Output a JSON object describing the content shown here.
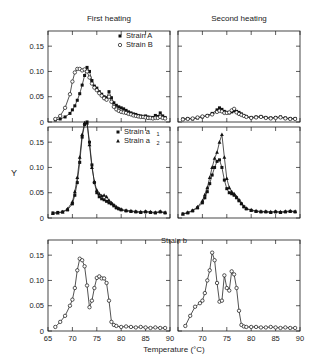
{
  "figure": {
    "y_axis_label": "Y",
    "x_axis_label": "Temperature (°C)",
    "column_titles": [
      "First heating",
      "Second heating"
    ],
    "y_ticks": [
      "0",
      "0.05",
      "0.10",
      "0.15"
    ],
    "x_ticks": [
      "65",
      "70",
      "75",
      "80",
      "85",
      "90"
    ],
    "legends": {
      "row1": [
        {
          "label": "Strain A",
          "marker": "filled-square"
        },
        {
          "label": "Strain B",
          "marker": "open-circle"
        }
      ],
      "row2": [
        {
          "label": "Strain a",
          "sub": "1",
          "marker": "filled-square"
        },
        {
          "label": "Strain a",
          "sub": "2",
          "marker": "filled-triangle"
        }
      ],
      "row3": [
        {
          "label": "Strain b",
          "marker": "open-circle"
        }
      ]
    }
  },
  "chart_data": {
    "type": "line",
    "title": "",
    "xlabel": "Temperature (°C)",
    "ylabel": "Y",
    "xlim": [
      65,
      90
    ],
    "ylim": [
      0,
      0.18
    ],
    "grid": false,
    "legend_position": "inside-top-right",
    "panels": [
      {
        "row": 1,
        "column": 1,
        "column_title": "First heating",
        "series": [
          {
            "name": "Strain A",
            "marker": "filled-square",
            "x": [
              66.5,
              67.5,
              68.5,
              69.5,
              70.0,
              70.5,
              71.0,
              71.5,
              72.0,
              72.5,
              73.0,
              73.5,
              74.0,
              74.5,
              75.0,
              75.5,
              76.0,
              76.5,
              77.0,
              77.5,
              78.0,
              78.5,
              79.0,
              79.5,
              80.0,
              80.5,
              81.0,
              81.5,
              82.0,
              82.5,
              83.0,
              83.5,
              84.0,
              84.5,
              85.0,
              85.5,
              86.0,
              86.5,
              87.0,
              87.5,
              88.0,
              88.5,
              89.0
            ],
            "y": [
              0.004,
              0.006,
              0.01,
              0.017,
              0.024,
              0.032,
              0.043,
              0.056,
              0.073,
              0.092,
              0.108,
              0.1,
              0.082,
              0.071,
              0.067,
              0.06,
              0.055,
              0.05,
              0.048,
              0.06,
              0.048,
              0.038,
              0.033,
              0.03,
              0.028,
              0.026,
              0.023,
              0.02,
              0.018,
              0.016,
              0.015,
              0.013,
              0.012,
              0.011,
              0.012,
              0.01,
              0.009,
              0.009,
              0.013,
              0.011,
              0.018,
              0.012,
              0.009
            ]
          },
          {
            "name": "Strain B",
            "marker": "open-circle",
            "x": [
              66.5,
              67.5,
              68.5,
              69.5,
              70.0,
              70.5,
              71.0,
              71.5,
              72.0,
              72.5,
              73.0,
              73.5,
              74.0,
              74.5,
              75.0,
              75.5,
              76.0,
              76.5,
              77.0,
              77.5,
              78.0,
              78.5,
              79.0,
              79.5,
              80.0,
              80.5,
              81.0,
              81.5,
              82.0,
              82.5,
              83.0,
              83.5,
              84.0,
              84.5,
              85.0,
              85.5,
              86.0,
              86.5,
              87.0,
              87.5,
              88.0,
              88.5,
              89.0
            ],
            "y": [
              0.006,
              0.012,
              0.028,
              0.055,
              0.08,
              0.098,
              0.105,
              0.105,
              0.102,
              0.104,
              0.1,
              0.088,
              0.076,
              0.068,
              0.063,
              0.057,
              0.052,
              0.047,
              0.044,
              0.05,
              0.04,
              0.03,
              0.025,
              0.022,
              0.02,
              0.019,
              0.018,
              0.016,
              0.015,
              0.013,
              0.012,
              0.011,
              0.01,
              0.01,
              0.009,
              0.008,
              0.008,
              0.007,
              0.008,
              0.008,
              0.01,
              0.008,
              0.007
            ]
          }
        ]
      },
      {
        "row": 1,
        "column": 2,
        "column_title": "Second heating",
        "series": [
          {
            "name": "Strain A",
            "marker": "filled-square",
            "x": [
              66.0,
              67.0,
              68.0,
              69.0,
              70.0,
              71.0,
              72.0,
              73.0,
              73.5,
              74.0,
              74.5,
              75.0,
              75.5,
              76.0,
              76.5,
              77.0,
              77.5,
              78.0,
              78.5,
              79.0,
              80.0,
              81.0,
              82.0,
              83.0,
              84.0,
              85.0,
              86.0,
              87.0,
              88.0,
              89.0
            ],
            "y": [
              0.006,
              0.007,
              0.006,
              0.008,
              0.01,
              0.013,
              0.017,
              0.024,
              0.028,
              0.025,
              0.021,
              0.019,
              0.018,
              0.02,
              0.022,
              0.021,
              0.019,
              0.016,
              0.013,
              0.011,
              0.009,
              0.01,
              0.011,
              0.009,
              0.008,
              0.009,
              0.01,
              0.008,
              0.007,
              0.007
            ]
          },
          {
            "name": "Strain B",
            "marker": "open-circle",
            "x": [
              66.0,
              67.0,
              68.0,
              69.0,
              70.0,
              71.0,
              72.0,
              73.0,
              73.5,
              74.0,
              74.5,
              75.0,
              75.5,
              76.0,
              76.5,
              77.0,
              77.5,
              78.0,
              78.5,
              79.0,
              80.0,
              81.0,
              82.0,
              83.0,
              84.0,
              85.0,
              86.0,
              87.0,
              88.0,
              89.0
            ],
            "y": [
              0.005,
              0.006,
              0.007,
              0.009,
              0.011,
              0.012,
              0.015,
              0.02,
              0.022,
              0.021,
              0.018,
              0.018,
              0.019,
              0.023,
              0.026,
              0.019,
              0.016,
              0.014,
              0.012,
              0.01,
              0.008,
              0.009,
              0.01,
              0.008,
              0.007,
              0.008,
              0.009,
              0.007,
              0.006,
              0.006
            ]
          }
        ]
      },
      {
        "row": 2,
        "column": 1,
        "column_title": "First heating",
        "series": [
          {
            "name": "Strain a1",
            "marker": "filled-square",
            "x": [
              66.0,
              67.0,
              68.0,
              69.0,
              70.0,
              70.5,
              71.0,
              71.5,
              72.0,
              72.5,
              73.0,
              73.5,
              74.0,
              74.5,
              75.0,
              75.5,
              76.0,
              76.5,
              77.0,
              77.5,
              78.0,
              78.5,
              79.0,
              79.5,
              80.0,
              81.0,
              82.0,
              83.0,
              84.0,
              85.0,
              86.0,
              87.0,
              88.0,
              89.0
            ],
            "y": [
              0.01,
              0.011,
              0.012,
              0.016,
              0.028,
              0.045,
              0.07,
              0.11,
              0.16,
              0.185,
              0.19,
              0.15,
              0.105,
              0.07,
              0.05,
              0.042,
              0.038,
              0.036,
              0.033,
              0.03,
              0.028,
              0.024,
              0.02,
              0.018,
              0.016,
              0.014,
              0.013,
              0.012,
              0.011,
              0.012,
              0.011,
              0.01,
              0.012,
              0.01
            ]
          },
          {
            "name": "Strain a2",
            "marker": "filled-triangle",
            "x": [
              66.0,
              67.0,
              68.0,
              69.0,
              70.0,
              70.5,
              71.0,
              71.5,
              72.0,
              72.5,
              73.0,
              73.5,
              74.0,
              74.5,
              75.0,
              75.5,
              76.0,
              76.5,
              77.0,
              77.5,
              78.0,
              78.5,
              79.0,
              79.5,
              80.0,
              81.0,
              82.0,
              83.0,
              84.0,
              85.0,
              86.0,
              87.0,
              88.0,
              89.0
            ],
            "y": [
              0.009,
              0.01,
              0.012,
              0.018,
              0.032,
              0.052,
              0.08,
              0.12,
              0.165,
              0.188,
              0.188,
              0.145,
              0.1,
              0.072,
              0.055,
              0.048,
              0.044,
              0.045,
              0.042,
              0.035,
              0.03,
              0.026,
              0.022,
              0.019,
              0.017,
              0.015,
              0.014,
              0.013,
              0.012,
              0.013,
              0.012,
              0.011,
              0.013,
              0.011
            ]
          }
        ]
      },
      {
        "row": 2,
        "column": 2,
        "column_title": "Second heating",
        "series": [
          {
            "name": "Strain a1",
            "marker": "filled-square",
            "x": [
              66.0,
              67.0,
              68.0,
              69.0,
              70.0,
              70.5,
              71.0,
              71.5,
              72.0,
              72.5,
              73.0,
              73.5,
              74.0,
              74.5,
              75.0,
              75.5,
              76.0,
              76.5,
              77.0,
              77.5,
              78.0,
              78.5,
              79.0,
              80.0,
              81.0,
              82.0,
              83.0,
              84.0,
              85.0,
              86.0,
              87.0,
              88.0,
              89.0
            ],
            "y": [
              0.008,
              0.01,
              0.014,
              0.02,
              0.03,
              0.04,
              0.052,
              0.068,
              0.085,
              0.1,
              0.112,
              0.115,
              0.1,
              0.075,
              0.058,
              0.05,
              0.048,
              0.045,
              0.04,
              0.034,
              0.028,
              0.022,
              0.018,
              0.015,
              0.013,
              0.012,
              0.012,
              0.011,
              0.012,
              0.011,
              0.012,
              0.013,
              0.012
            ]
          },
          {
            "name": "Strain a2",
            "marker": "filled-triangle",
            "x": [
              66.0,
              67.0,
              68.0,
              69.0,
              70.0,
              70.5,
              71.0,
              71.5,
              72.0,
              72.5,
              73.0,
              73.5,
              74.0,
              74.5,
              75.0,
              75.5,
              76.0,
              76.5,
              77.0,
              77.5,
              78.0,
              78.5,
              79.0,
              80.0,
              81.0,
              82.0,
              83.0,
              84.0,
              85.0,
              86.0,
              87.0,
              88.0,
              89.0
            ],
            "y": [
              0.008,
              0.011,
              0.015,
              0.022,
              0.034,
              0.046,
              0.06,
              0.08,
              0.1,
              0.118,
              0.13,
              0.15,
              0.165,
              0.12,
              0.078,
              0.06,
              0.052,
              0.048,
              0.042,
              0.036,
              0.029,
              0.023,
              0.019,
              0.016,
              0.014,
              0.013,
              0.013,
              0.012,
              0.013,
              0.012,
              0.013,
              0.014,
              0.013
            ]
          }
        ]
      },
      {
        "row": 3,
        "column": 1,
        "column_title": "First heating",
        "series": [
          {
            "name": "Strain b",
            "marker": "open-circle",
            "x": [
              66.5,
              67.5,
              68.5,
              69.5,
              70.0,
              70.5,
              71.0,
              71.5,
              72.0,
              72.5,
              73.0,
              73.5,
              74.0,
              74.5,
              75.0,
              75.5,
              76.0,
              76.5,
              77.0,
              77.5,
              78.0,
              78.5,
              79.0,
              80.0,
              81.0,
              82.0,
              83.0,
              84.0,
              85.0,
              86.0,
              87.0,
              88.0,
              89.0
            ],
            "y": [
              0.008,
              0.018,
              0.03,
              0.05,
              0.062,
              0.085,
              0.12,
              0.143,
              0.14,
              0.128,
              0.09,
              0.047,
              0.06,
              0.085,
              0.105,
              0.108,
              0.104,
              0.104,
              0.095,
              0.06,
              0.018,
              0.012,
              0.01,
              0.008,
              0.009,
              0.008,
              0.007,
              0.008,
              0.007,
              0.006,
              0.007,
              0.006,
              0.006
            ]
          }
        ]
      },
      {
        "row": 3,
        "column": 2,
        "column_title": "Second heating",
        "series": [
          {
            "name": "Strain b",
            "marker": "open-circle",
            "x": [
              66.5,
              67.5,
              68.5,
              69.5,
              70.0,
              70.5,
              71.0,
              71.5,
              72.0,
              72.5,
              73.0,
              73.5,
              74.0,
              74.5,
              75.0,
              75.5,
              76.0,
              76.5,
              77.0,
              77.5,
              78.0,
              78.5,
              79.0,
              80.0,
              81.0,
              82.0,
              83.0,
              84.0,
              85.0,
              86.0,
              87.0,
              88.0,
              89.0
            ],
            "y": [
              0.01,
              0.03,
              0.048,
              0.055,
              0.06,
              0.075,
              0.1,
              0.12,
              0.155,
              0.14,
              0.095,
              0.058,
              0.06,
              0.11,
              0.085,
              0.08,
              0.118,
              0.112,
              0.085,
              0.04,
              0.012,
              0.009,
              0.008,
              0.008,
              0.008,
              0.007,
              0.007,
              0.008,
              0.007,
              0.006,
              0.007,
              0.006,
              0.006
            ]
          }
        ]
      }
    ]
  }
}
